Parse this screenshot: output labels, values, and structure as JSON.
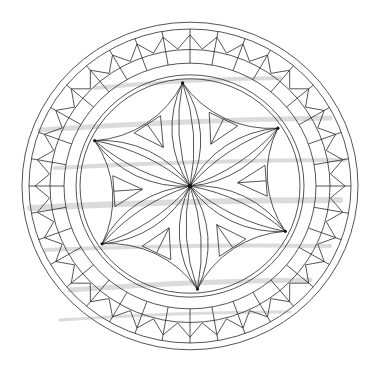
{
  "drawing": {
    "subject": "chip-carving rosette plate pattern",
    "background": "#ffffff",
    "line_color": "#2a2a2a",
    "rim_color": "#555555",
    "grain_color": "#cfcfcf",
    "center": [
      190,
      186
    ],
    "scale_y": 0.975,
    "rim": {
      "outer_r": 168,
      "inner_r": 161
    },
    "border": {
      "divisions": 36,
      "inner_r": 126,
      "mid_r": 140,
      "zig_outer_r": 155,
      "zig_inner_r": 141
    },
    "inner_ring": {
      "outer_r": 114,
      "inner_r": 110
    },
    "rosette": {
      "petals": 6,
      "radius": 106,
      "rotation_deg": -94,
      "triangle_count": 6
    },
    "grain_streaks": [
      [
        40,
        130,
        330,
        118,
        5
      ],
      [
        55,
        168,
        345,
        160,
        4
      ],
      [
        30,
        208,
        340,
        200,
        6
      ],
      [
        45,
        250,
        330,
        246,
        4
      ],
      [
        70,
        290,
        310,
        280,
        5
      ],
      [
        95,
        88,
        280,
        78,
        4
      ],
      [
        60,
        320,
        290,
        312,
        3
      ]
    ]
  }
}
